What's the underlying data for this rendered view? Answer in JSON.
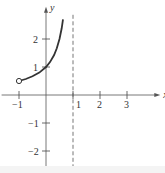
{
  "chart_data": {
    "type": "line",
    "title": "",
    "xlabel": "x",
    "ylabel": "y",
    "xlim": [
      -1.2,
      3.9
    ],
    "ylim": [
      -2.4,
      2.9
    ],
    "grid": false,
    "x_ticks": [
      -1,
      1,
      2,
      3
    ],
    "x_tick_labels": [
      "−1",
      "1",
      "2",
      "3"
    ],
    "y_ticks": [
      -2,
      -1,
      1,
      2
    ],
    "y_tick_labels": [
      "−2",
      "−1",
      "1",
      "2"
    ],
    "series": [
      {
        "name": "f(x) = 1/(1 - x)",
        "x": [
          -1,
          -0.75,
          -0.5,
          -0.25,
          0,
          0.15,
          0.3,
          0.4,
          0.5,
          0.58,
          0.63
        ],
        "y": [
          0.5,
          0.571,
          0.667,
          0.8,
          1,
          1.176,
          1.429,
          1.667,
          2,
          2.381,
          2.703
        ]
      }
    ],
    "open_point": {
      "x": -1,
      "y": 0.5
    },
    "asymptote": {
      "type": "vertical",
      "x": 1,
      "style": "dashed"
    }
  }
}
